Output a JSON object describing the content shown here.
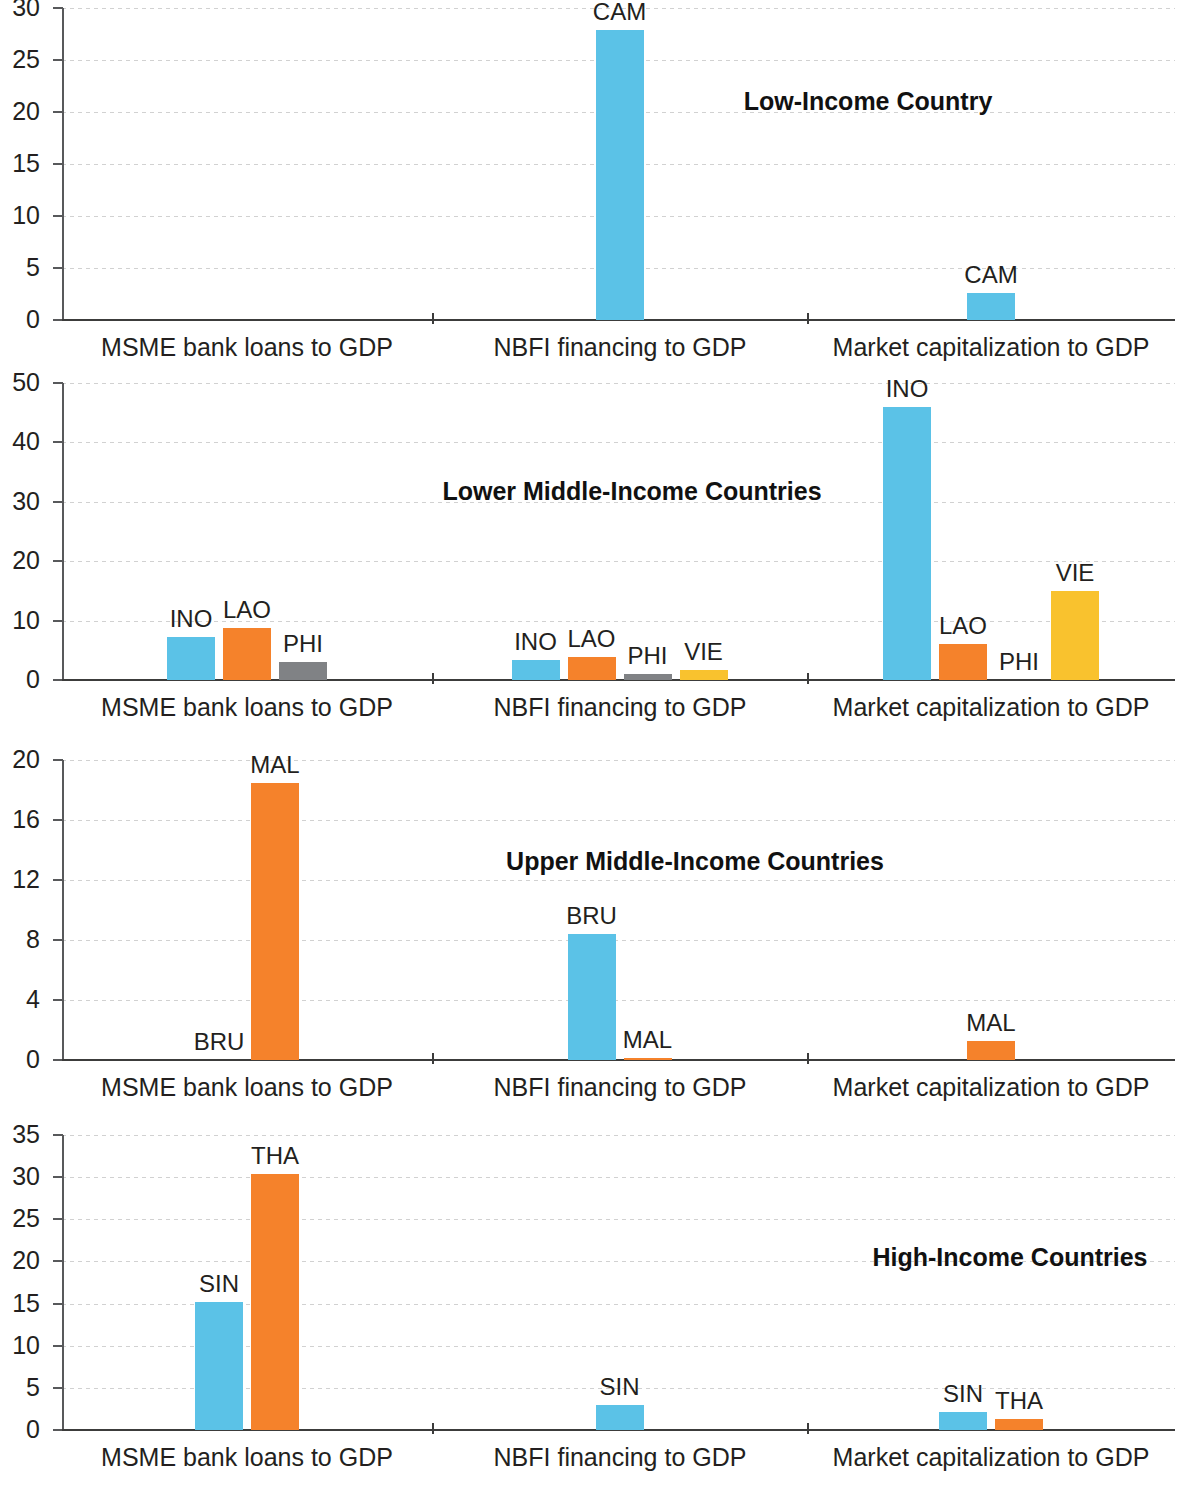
{
  "chart_data": {
    "type": "bar",
    "title": "",
    "xlabel": "",
    "ylabel": "",
    "grid": true,
    "legend_position": "none",
    "note": "Four stacked small-multiple bar panels by income group; bars labelled with country codes.",
    "series_colors": {
      "blue": "#5BC2E7",
      "orange": "#F5822B",
      "gray": "#808285",
      "yellow": "#F9C22E"
    },
    "categories": [
      "MSME bank loans to GDP",
      "NBFI financing to GDP",
      "Market capitalization to GDP"
    ],
    "panels": [
      {
        "title": "Low-Income Country",
        "ylim": [
          0,
          30
        ],
        "yticks": [
          0,
          5,
          10,
          15,
          20,
          25,
          30
        ],
        "groups": [
          {
            "category": "MSME bank loans to GDP",
            "bars": []
          },
          {
            "category": "NBFI financing to GDP",
            "bars": [
              {
                "label": "CAM",
                "value": 27.9,
                "color": "blue"
              }
            ]
          },
          {
            "category": "Market capitalization to GDP",
            "bars": [
              {
                "label": "CAM",
                "value": 2.6,
                "color": "blue"
              }
            ]
          }
        ]
      },
      {
        "title": "Lower Middle-Income Countries",
        "ylim": [
          0,
          50
        ],
        "yticks": [
          0,
          10,
          20,
          30,
          40,
          50
        ],
        "groups": [
          {
            "category": "MSME bank loans to GDP",
            "bars": [
              {
                "label": "INO",
                "value": 7.2,
                "color": "blue"
              },
              {
                "label": "LAO",
                "value": 8.8,
                "color": "orange"
              },
              {
                "label": "PHI",
                "value": 3.1,
                "color": "gray"
              }
            ]
          },
          {
            "category": "NBFI financing to GDP",
            "bars": [
              {
                "label": "INO",
                "value": 3.3,
                "color": "blue"
              },
              {
                "label": "LAO",
                "value": 3.9,
                "color": "orange"
              },
              {
                "label": "PHI",
                "value": 1.0,
                "color": "gray"
              },
              {
                "label": "VIE",
                "value": 1.7,
                "color": "yellow"
              }
            ]
          },
          {
            "category": "Market capitalization to GDP",
            "bars": [
              {
                "label": "INO",
                "value": 46.0,
                "color": "blue"
              },
              {
                "label": "LAO",
                "value": 6.0,
                "color": "orange"
              },
              {
                "label": "PHI",
                "value": 0.0,
                "color": "gray"
              },
              {
                "label": "VIE",
                "value": 15.0,
                "color": "yellow"
              }
            ]
          }
        ]
      },
      {
        "title": "Upper Middle-Income Countries",
        "ylim": [
          0,
          20
        ],
        "yticks": [
          0,
          4,
          8,
          12,
          16,
          20
        ],
        "groups": [
          {
            "category": "MSME bank loans to GDP",
            "bars": [
              {
                "label": "BRU",
                "value": 0.0,
                "color": "blue"
              },
              {
                "label": "MAL",
                "value": 18.5,
                "color": "orange"
              }
            ]
          },
          {
            "category": "NBFI financing to GDP",
            "bars": [
              {
                "label": "BRU",
                "value": 8.4,
                "color": "blue"
              },
              {
                "label": "MAL",
                "value": 0.1,
                "color": "orange"
              }
            ]
          },
          {
            "category": "Market capitalization to GDP",
            "bars": [
              {
                "label": "MAL",
                "value": 1.3,
                "color": "orange"
              }
            ]
          }
        ]
      },
      {
        "title": "High-Income Countries",
        "ylim": [
          0,
          35
        ],
        "yticks": [
          0,
          5,
          10,
          15,
          20,
          25,
          30,
          35
        ],
        "groups": [
          {
            "category": "MSME bank loans to GDP",
            "bars": [
              {
                "label": "SIN",
                "value": 15.2,
                "color": "blue"
              },
              {
                "label": "THA",
                "value": 30.4,
                "color": "orange"
              }
            ]
          },
          {
            "category": "NBFI financing to GDP",
            "bars": [
              {
                "label": "SIN",
                "value": 3.0,
                "color": "blue"
              }
            ]
          },
          {
            "category": "Market capitalization to GDP",
            "bars": [
              {
                "label": "SIN",
                "value": 2.1,
                "color": "blue"
              },
              {
                "label": "THA",
                "value": 1.3,
                "color": "orange"
              }
            ]
          }
        ]
      }
    ]
  },
  "layout": {
    "panel_tops": [
      8,
      383,
      760,
      1135
    ],
    "plot_heights": [
      312,
      297,
      300,
      295
    ],
    "plot_left": 62,
    "plot_right": 1175,
    "separators": [
      432,
      807
    ],
    "title_positions": [
      {
        "x": 868,
        "y": 88
      },
      {
        "x": 632,
        "y": 478
      },
      {
        "x": 695,
        "y": 848
      },
      {
        "x": 1010,
        "y": 1244
      }
    ],
    "group_label_centers": [
      247,
      620,
      991
    ],
    "group_label_offsets": [
      336,
      707,
      1087,
      1464
    ]
  }
}
